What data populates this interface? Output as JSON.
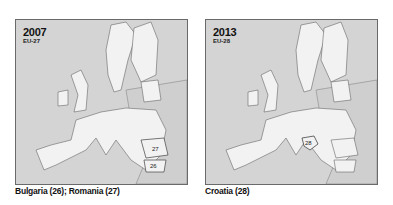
{
  "panels": [
    {
      "year": "2007",
      "label": "EU-27",
      "caption": "Bulgaria (26); Romania (27)",
      "country_labels": [
        {
          "country": "Romania",
          "number": "27"
        },
        {
          "country": "Bulgaria",
          "number": "26"
        }
      ]
    },
    {
      "year": "2013",
      "label": "EU-28",
      "caption": "Croatia (28)",
      "country_labels": [
        {
          "country": "Croatia",
          "number": "28"
        }
      ]
    }
  ],
  "colors": {
    "sea": "#d4d4d4",
    "eu_member": "#f2f2f2",
    "non_member": "#cfcfcf",
    "border": "#6a6a6a"
  }
}
